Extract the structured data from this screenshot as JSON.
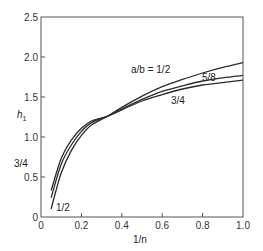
{
  "chart_data": {
    "type": "line",
    "title": "",
    "xlabel": "1/n",
    "ylabel": "h1",
    "xlim": [
      0,
      1.0
    ],
    "ylim": [
      0,
      2.5
    ],
    "grid": false,
    "x_ticks": [
      "0",
      "0.2",
      "0.4",
      "0.6",
      "0.8",
      "1.0"
    ],
    "y_ticks": [
      "0",
      "0.5",
      "1.0",
      "1.5",
      "2.0",
      "2.5"
    ],
    "x": [
      0.05,
      0.1,
      0.15,
      0.2,
      0.25,
      0.33,
      0.4,
      0.5,
      0.6,
      0.7,
      0.8,
      0.9,
      1.0
    ],
    "series": [
      {
        "name": "a/b = 1/2",
        "values": [
          0.1,
          0.55,
          0.83,
          1.02,
          1.15,
          1.26,
          1.37,
          1.51,
          1.63,
          1.72,
          1.8,
          1.87,
          1.93
        ]
      },
      {
        "name": "5/8",
        "values": [
          0.24,
          0.66,
          0.9,
          1.07,
          1.18,
          1.26,
          1.35,
          1.47,
          1.57,
          1.64,
          1.7,
          1.74,
          1.77
        ]
      },
      {
        "name": "3/4",
        "values": [
          0.33,
          0.73,
          0.96,
          1.11,
          1.2,
          1.26,
          1.34,
          1.45,
          1.53,
          1.6,
          1.65,
          1.68,
          1.71
        ]
      }
    ],
    "annotations": [
      {
        "text": "a/b = 1/2",
        "x": 0.6,
        "y": 1.82
      },
      {
        "text": "5/8",
        "x": 0.8,
        "y": 1.71
      },
      {
        "text": "3/4",
        "x": 0.63,
        "y": 1.44
      },
      {
        "text": "3/4",
        "x": -0.13,
        "y": 0.65
      },
      {
        "text": "1/2",
        "x": 0.08,
        "y": 0.12
      }
    ]
  },
  "labels": {
    "y_axis": "h",
    "y_axis_sub": "1",
    "x_axis": "1/n",
    "curve_top": "a/b = 1/2",
    "curve_mid": "5/8",
    "curve_low": "3/4",
    "left_top": "3/4",
    "left_bottom": "1/2"
  }
}
